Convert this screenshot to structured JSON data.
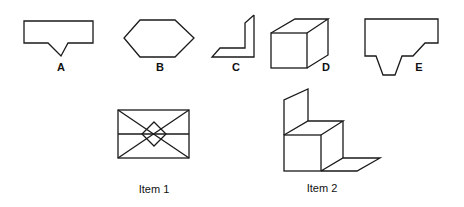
{
  "options": [
    {
      "id": "A",
      "label": "A",
      "shape": "rectangle-with-v-notch"
    },
    {
      "id": "B",
      "label": "B",
      "shape": "hexagon"
    },
    {
      "id": "C",
      "label": "C",
      "shape": "angle-bracket-3d"
    },
    {
      "id": "D",
      "label": "D",
      "shape": "cube"
    },
    {
      "id": "E",
      "label": "E",
      "shape": "stepped-trapezoid-profile"
    }
  ],
  "items": [
    {
      "id": "item1",
      "label": "Item 1",
      "shape": "rectangle-with-diagonals-midline-and-diamond"
    },
    {
      "id": "item2",
      "label": "Item 2",
      "shape": "cube-with-back-panel-and-floor"
    }
  ],
  "colors": {
    "line": "#1a1a1a",
    "background": "#ffffff"
  }
}
